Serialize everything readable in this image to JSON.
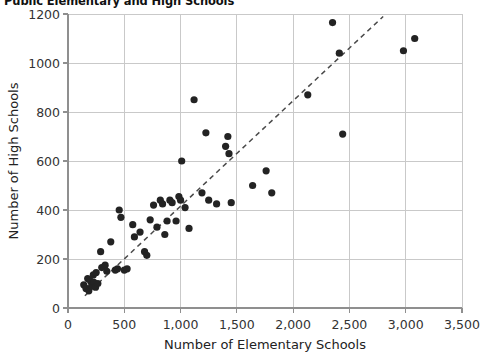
{
  "chart_data": {
    "type": "scatter",
    "title": "Public Elementary and High Schools",
    "xlabel": "Number of Elementary Schools",
    "ylabel": "Number of High Schools",
    "xlim": [
      0,
      3500
    ],
    "ylim": [
      0,
      1200
    ],
    "xticks": [
      0,
      500,
      1000,
      1500,
      2000,
      2500,
      3000,
      3500
    ],
    "xtick_labels": [
      "0",
      "500",
      "1,000",
      "1,500",
      "2,000",
      "2,500",
      "3,000",
      "3,500"
    ],
    "yticks": [
      0,
      200,
      400,
      600,
      800,
      1000,
      1200
    ],
    "ytick_labels": [
      "0",
      "200",
      "400",
      "600",
      "800",
      "1000",
      "1200"
    ],
    "grid": true,
    "legend": "none",
    "point_color": "#232323",
    "trendline": {
      "style": "dashed",
      "color": "#4a4a4a",
      "x": [
        150,
        2800
      ],
      "y": [
        50,
        1190
      ]
    },
    "points": [
      {
        "x": 140,
        "y": 95
      },
      {
        "x": 160,
        "y": 80
      },
      {
        "x": 175,
        "y": 120
      },
      {
        "x": 185,
        "y": 70
      },
      {
        "x": 200,
        "y": 110
      },
      {
        "x": 210,
        "y": 90
      },
      {
        "x": 225,
        "y": 135
      },
      {
        "x": 230,
        "y": 105
      },
      {
        "x": 245,
        "y": 85
      },
      {
        "x": 250,
        "y": 145
      },
      {
        "x": 265,
        "y": 100
      },
      {
        "x": 290,
        "y": 230
      },
      {
        "x": 300,
        "y": 165
      },
      {
        "x": 330,
        "y": 175
      },
      {
        "x": 345,
        "y": 150
      },
      {
        "x": 380,
        "y": 270
      },
      {
        "x": 420,
        "y": 155
      },
      {
        "x": 440,
        "y": 160
      },
      {
        "x": 455,
        "y": 400
      },
      {
        "x": 470,
        "y": 370
      },
      {
        "x": 500,
        "y": 155
      },
      {
        "x": 525,
        "y": 160
      },
      {
        "x": 575,
        "y": 340
      },
      {
        "x": 590,
        "y": 290
      },
      {
        "x": 640,
        "y": 310
      },
      {
        "x": 680,
        "y": 230
      },
      {
        "x": 700,
        "y": 215
      },
      {
        "x": 730,
        "y": 360
      },
      {
        "x": 760,
        "y": 420
      },
      {
        "x": 790,
        "y": 330
      },
      {
        "x": 820,
        "y": 440
      },
      {
        "x": 840,
        "y": 425
      },
      {
        "x": 860,
        "y": 300
      },
      {
        "x": 880,
        "y": 355
      },
      {
        "x": 905,
        "y": 440
      },
      {
        "x": 925,
        "y": 430
      },
      {
        "x": 960,
        "y": 355
      },
      {
        "x": 985,
        "y": 455
      },
      {
        "x": 1000,
        "y": 440
      },
      {
        "x": 1010,
        "y": 600
      },
      {
        "x": 1040,
        "y": 410
      },
      {
        "x": 1075,
        "y": 325
      },
      {
        "x": 1120,
        "y": 850
      },
      {
        "x": 1190,
        "y": 470
      },
      {
        "x": 1225,
        "y": 715
      },
      {
        "x": 1250,
        "y": 440
      },
      {
        "x": 1320,
        "y": 425
      },
      {
        "x": 1400,
        "y": 660
      },
      {
        "x": 1420,
        "y": 700
      },
      {
        "x": 1430,
        "y": 630
      },
      {
        "x": 1450,
        "y": 430
      },
      {
        "x": 1640,
        "y": 500
      },
      {
        "x": 1760,
        "y": 560
      },
      {
        "x": 1810,
        "y": 470
      },
      {
        "x": 2130,
        "y": 870
      },
      {
        "x": 2350,
        "y": 1165
      },
      {
        "x": 2410,
        "y": 1040
      },
      {
        "x": 2440,
        "y": 710
      },
      {
        "x": 2980,
        "y": 1050
      },
      {
        "x": 3080,
        "y": 1100
      }
    ]
  }
}
